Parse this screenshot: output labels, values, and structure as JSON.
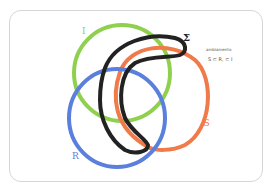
{
  "diagram": {
    "type": "linked-rings",
    "rings": [
      {
        "id": "I",
        "label": "I",
        "color": "#8fd14f"
      },
      {
        "id": "Sigma",
        "label": "Σ",
        "color": "#222222"
      },
      {
        "id": "S",
        "label": "S",
        "color": "#f07a4a"
      },
      {
        "id": "R",
        "label": "R",
        "color": "#5b7fdc"
      }
    ],
    "note": {
      "line1": "ambiamento",
      "line2": "S ⊂ R, ⊂ I"
    }
  }
}
